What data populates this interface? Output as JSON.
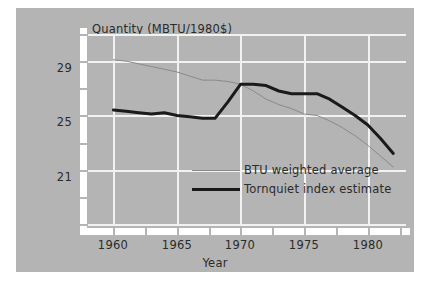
{
  "chart_data": {
    "type": "line",
    "title": "",
    "ylabel": "Quantity (MBTU/1980$)",
    "xlabel": "Year",
    "grid": true,
    "legend_position": "inside-lower-right",
    "xlim": [
      1958,
      1983
    ],
    "ylim": [
      17,
      31
    ],
    "xticks": [
      1960,
      1965,
      1970,
      1975,
      1980
    ],
    "xtick_labels": [
      "1960",
      "1965",
      "1970",
      "1975",
      "1980"
    ],
    "xticks_minor": [
      1962.5,
      1967.5,
      1972.5,
      1977.5,
      1982.5
    ],
    "yticks": [
      21,
      25,
      29
    ],
    "ytick_labels": [
      "21",
      "25",
      "29"
    ],
    "yticks_minor": [
      19,
      23,
      27,
      31
    ],
    "series": [
      {
        "name": "BTU weighted average",
        "color": "#8a8a8a",
        "width": 1,
        "x": [
          1960,
          1961,
          1962,
          1963,
          1964,
          1965,
          1966,
          1967,
          1968,
          1969,
          1970,
          1971,
          1972,
          1973,
          1974,
          1975,
          1976,
          1977,
          1978,
          1979,
          1980,
          1981,
          1982
        ],
        "values": [
          29.1,
          29.0,
          28.8,
          28.6,
          28.4,
          28.2,
          27.9,
          27.6,
          27.6,
          27.5,
          27.3,
          26.8,
          26.2,
          25.8,
          25.5,
          25.1,
          25.0,
          24.6,
          24.1,
          23.5,
          22.8,
          22.0,
          21.2
        ]
      },
      {
        "name": "Tornquiet index estimate",
        "color": "#1a1a1a",
        "width": 3,
        "x": [
          1960,
          1961,
          1962,
          1963,
          1964,
          1965,
          1966,
          1967,
          1968,
          1969,
          1970,
          1971,
          1972,
          1973,
          1974,
          1975,
          1976,
          1977,
          1978,
          1979,
          1980,
          1981,
          1982
        ],
        "values": [
          25.4,
          25.3,
          25.2,
          25.1,
          25.2,
          25.0,
          24.9,
          24.8,
          24.8,
          26.0,
          27.3,
          27.3,
          27.2,
          26.8,
          26.6,
          26.6,
          26.6,
          26.2,
          25.6,
          25.0,
          24.3,
          23.3,
          22.2
        ]
      }
    ]
  },
  "axes": {
    "y_title": "Quantity (MBTU/1980$)",
    "x_title": "Year",
    "y_labels": [
      "29",
      "25",
      "21"
    ],
    "x_labels": [
      "1960",
      "1965",
      "1970",
      "1975",
      "1980"
    ]
  },
  "legend": {
    "items": [
      {
        "label": "BTU weighted average",
        "style": "thin-gray-line"
      },
      {
        "label": "Tornquiet index estimate",
        "style": "thick-black-line"
      }
    ]
  },
  "colors": {
    "panel_background": "#b4b4b4",
    "page_background": "#ffffff",
    "gridline": "#f2f2f2",
    "axis_band": "#ffffff",
    "series_gray": "#8a8a8a",
    "series_black": "#1a1a1a",
    "text": "#2b2b2b"
  }
}
